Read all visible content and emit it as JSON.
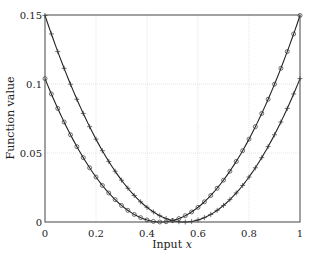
{
  "chart_data": {
    "type": "line",
    "title": "",
    "xlabel": "Input x",
    "ylabel": "Function value",
    "xlim": [
      0,
      1
    ],
    "ylim": [
      0,
      0.15
    ],
    "xticks": [
      "0",
      "0.2",
      "0.4",
      "0.6",
      "0.8",
      "1"
    ],
    "yticks": [
      "0",
      "0.05",
      "0.1",
      "0.15"
    ],
    "grid": true,
    "legend": null,
    "series": [
      {
        "name": "curve-circles",
        "marker": "circle",
        "x": [
          0,
          0.1,
          0.2,
          0.3,
          0.4,
          0.45,
          0.5,
          0.6,
          0.7,
          0.8,
          0.9,
          1.0
        ],
        "values": [
          0.104,
          0.064,
          0.033,
          0.012,
          0.0015,
          0.0,
          0.001,
          0.011,
          0.03,
          0.06,
          0.1,
          0.15
        ]
      },
      {
        "name": "curve-plus",
        "marker": "plus",
        "x": [
          0,
          0.1,
          0.2,
          0.3,
          0.4,
          0.5,
          0.55,
          0.6,
          0.7,
          0.8,
          0.9,
          1.0
        ],
        "values": [
          0.15,
          0.1,
          0.06,
          0.03,
          0.011,
          0.001,
          0.0,
          0.0015,
          0.012,
          0.033,
          0.064,
          0.104
        ]
      }
    ]
  },
  "axes": {
    "xlabel_text": "Input ",
    "xlabel_var": "x",
    "ylabel_text": "Function value"
  }
}
